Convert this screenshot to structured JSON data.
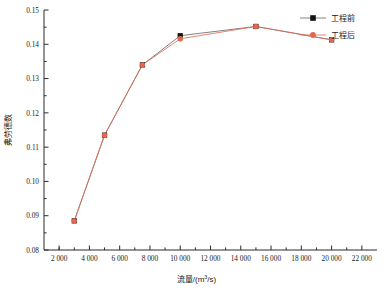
{
  "chart_data": {
    "type": "line",
    "title": "",
    "xlabel": "流量/(m³/s)",
    "ylabel": "弗劳德数",
    "xlim": [
      1000,
      23000
    ],
    "ylim": [
      0.08,
      0.15
    ],
    "xticks": [
      2000,
      4000,
      6000,
      8000,
      10000,
      12000,
      14000,
      16000,
      18000,
      20000,
      22000
    ],
    "xtick_labels": [
      "2 000",
      "4 000",
      "6 000",
      "8 000",
      "10 000",
      "12 000",
      "14 000",
      "16 000",
      "18 000",
      "20 000",
      "22 000"
    ],
    "yticks": [
      0.08,
      0.09,
      0.1,
      0.11,
      0.12,
      0.13,
      0.14,
      0.15
    ],
    "ytick_labels": [
      "0.08",
      "0.09",
      "0.10",
      "0.11",
      "0.12",
      "0.13",
      "0.14",
      "0.15"
    ],
    "grid": false,
    "legend_position": "top-right",
    "series": [
      {
        "name": "工程前",
        "color": "#111111",
        "marker": "square",
        "x": [
          3000,
          5000,
          7500,
          10000,
          15000,
          20000
        ],
        "values": [
          0.0885,
          0.1135,
          0.134,
          0.1425,
          0.1452,
          0.1413
        ]
      },
      {
        "name": "工程后",
        "color": "#e2674f",
        "marker": "circle",
        "x": [
          3000,
          5000,
          7500,
          10000,
          15000,
          20000
        ],
        "values": [
          0.0885,
          0.1135,
          0.134,
          0.1416,
          0.1452,
          0.1413
        ]
      }
    ]
  },
  "legend": {
    "items": [
      {
        "label": "工程前"
      },
      {
        "label": "工程后"
      }
    ]
  },
  "axes": {
    "x_title": "流量/(m³/s)",
    "x_title_prefix": "流量/(m",
    "x_title_sup": "3",
    "x_title_suffix": "/s)",
    "y_title": "弗劳德数"
  },
  "colors": {
    "series_before": "#111111",
    "series_after": "#e2674f",
    "axis": "#2b2b2b",
    "background": "#ffffff"
  }
}
